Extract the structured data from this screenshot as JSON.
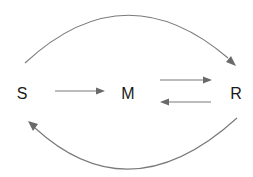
{
  "diagram": {
    "type": "state-transition",
    "nodes": [
      {
        "id": "S",
        "label": "S"
      },
      {
        "id": "M",
        "label": "M"
      },
      {
        "id": "R",
        "label": "R"
      }
    ],
    "edges": [
      {
        "from": "S",
        "to": "M",
        "shape": "straight"
      },
      {
        "from": "M",
        "to": "R",
        "shape": "straight"
      },
      {
        "from": "R",
        "to": "M",
        "shape": "straight"
      },
      {
        "from": "S",
        "to": "R",
        "shape": "arc-top"
      },
      {
        "from": "R",
        "to": "S",
        "shape": "arc-bottom"
      }
    ],
    "colors": {
      "edge": "#7a7a7a",
      "label": "#1a1a1a",
      "background": "#ffffff"
    }
  }
}
